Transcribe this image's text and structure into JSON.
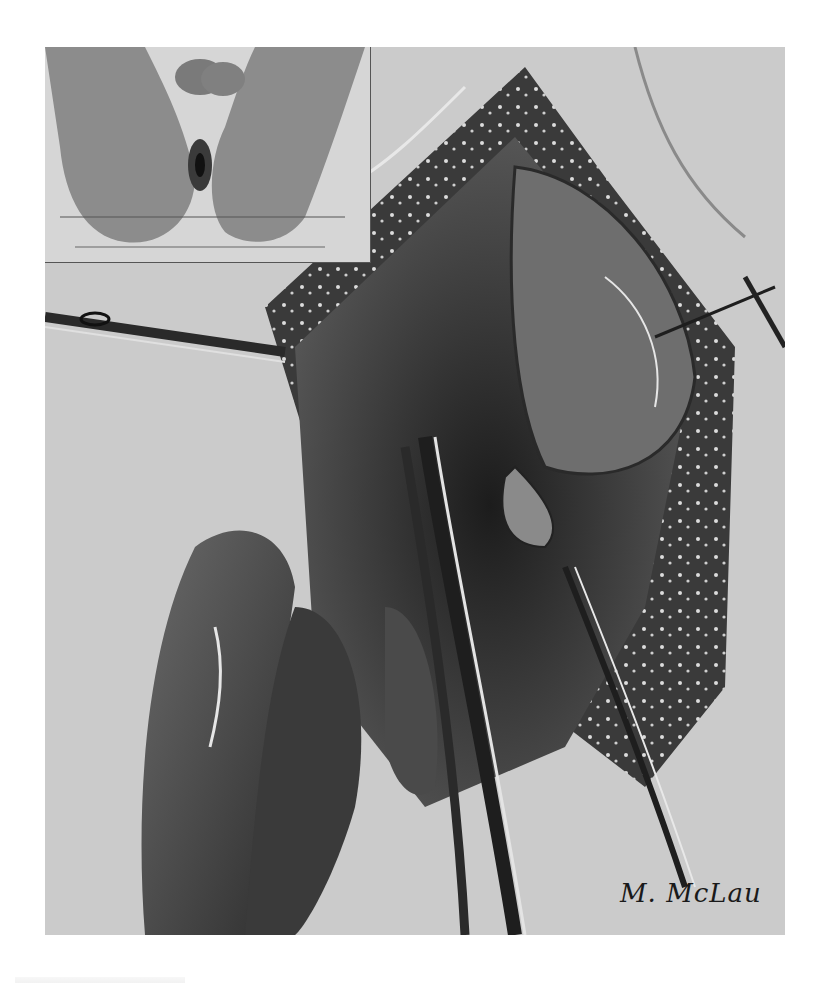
{
  "illustration": {
    "type": "surgical-illustration",
    "style": "grayscale engraving / pencil drawing",
    "signature": "M. McLau",
    "inset": {
      "description": "patient in lithotomy position, perineal view"
    },
    "main": {
      "description": "operative field with forceps, retractor and dissected tissue"
    },
    "colors": {
      "background": "#ffffff",
      "plate": "#cfcfcf",
      "dark": "#2a2a2a",
      "mid": "#7a7a7a",
      "light": "#e6e6e6"
    }
  }
}
